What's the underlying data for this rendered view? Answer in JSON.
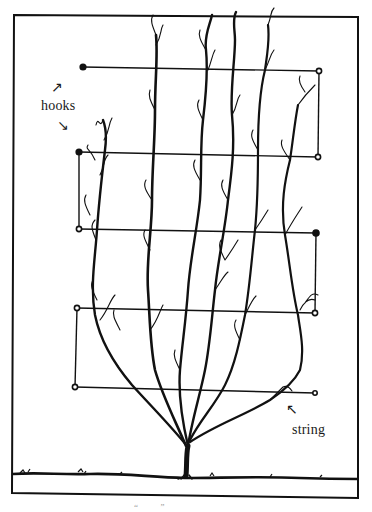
{
  "diagram": {
    "labels": {
      "hooks": "hooks",
      "string": "string",
      "hooks_arrow_up": "↗",
      "hooks_arrow_down": "↘",
      "string_arrow": "↖",
      "caption_marks": "“          ”"
    },
    "colors": {
      "ink": "#111111",
      "paper": "#ffffff"
    },
    "frame": {
      "x1": 14,
      "y1": 14,
      "x2": 358,
      "y2": 498
    },
    "hooks": [
      {
        "side": "left",
        "x": 83,
        "y": 67
      },
      {
        "side": "right",
        "x": 319,
        "y": 71
      },
      {
        "side": "left",
        "x": 79,
        "y": 152
      },
      {
        "side": "right",
        "x": 318,
        "y": 157
      },
      {
        "side": "left",
        "x": 79,
        "y": 229
      },
      {
        "side": "right",
        "x": 316,
        "y": 233
      },
      {
        "side": "left",
        "x": 77,
        "y": 308
      },
      {
        "side": "right",
        "x": 315,
        "y": 313
      },
      {
        "side": "left",
        "x": 75,
        "y": 387
      },
      {
        "side": "right",
        "x": 315,
        "y": 393
      }
    ],
    "strings": [
      {
        "from": 0,
        "to": 1
      },
      {
        "from": 1,
        "to": 3
      },
      {
        "from": 3,
        "to": 2
      },
      {
        "from": 2,
        "to": 4
      },
      {
        "from": 4,
        "to": 5
      },
      {
        "from": 5,
        "to": 7
      },
      {
        "from": 7,
        "to": 6
      },
      {
        "from": 6,
        "to": 8
      },
      {
        "from": 8,
        "to": 9
      }
    ],
    "ground_y": 475
  }
}
